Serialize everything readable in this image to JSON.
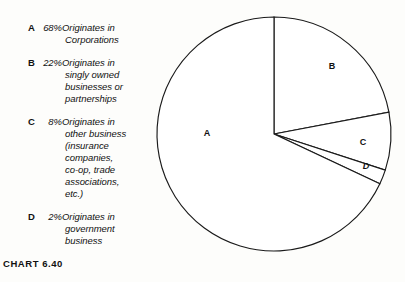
{
  "caption": "CHART 6.40",
  "legend": {
    "entries": [
      {
        "key": "A",
        "percent": "68%",
        "first_line": "Originates in",
        "rest_lines": [
          "Corporations"
        ],
        "full_text": "68% Originates in Corporations"
      },
      {
        "key": "B",
        "percent": "22%",
        "first_line": "Originates in",
        "rest_lines": [
          "singly owned",
          "businesses or",
          "partnerships"
        ],
        "full_text": "22% Originates in singly owned businesses or partnerships"
      },
      {
        "key": "C",
        "percent": "8%",
        "first_line": "Originates in",
        "rest_lines": [
          "other business",
          "(insurance",
          "companies,",
          "co-op, trade",
          "associations,",
          "etc.)"
        ],
        "full_text": "8% Originates in other business (insurance companies, co-op, trade associations, etc.)"
      },
      {
        "key": "D",
        "percent": "2%",
        "first_line": "Originates in",
        "rest_lines": [
          "government",
          "business"
        ],
        "full_text": "2% Originates in government business"
      }
    ]
  },
  "pie_labels": {
    "a": "A",
    "b": "B",
    "c": "C",
    "d": "D"
  },
  "colors": {
    "slice_fill": "#ffffff",
    "slice_stroke": "#1a1a1a",
    "text": "#111111",
    "background": "#fdfdfb"
  },
  "chart_data": {
    "type": "pie",
    "title": "CHART 6.40",
    "subtitle": "",
    "xlabel": "",
    "ylabel": "",
    "grid": false,
    "legend_position": "left",
    "start_angle_deg": 0,
    "direction": "clockwise",
    "units": "percent",
    "categories": [
      "A",
      "B",
      "C",
      "D"
    ],
    "values": [
      68,
      22,
      8,
      2
    ],
    "labels": [
      "A 68% Originates in Corporations",
      "B 22% Originates in singly owned businesses or partnerships",
      "C 8% Originates in other business (insurance companies, co-op, trade associations, etc.)",
      "D 2% Originates in government business"
    ],
    "slices": [
      {
        "key": "A",
        "value": 68,
        "display_value": "68%",
        "description": "Originates in Corporations",
        "fill": "#ffffff",
        "stroke": "#1a1a1a",
        "label_in_chart": "A"
      },
      {
        "key": "B",
        "value": 22,
        "display_value": "22%",
        "description": "Originates in singly owned businesses or partnerships",
        "fill": "#ffffff",
        "stroke": "#1a1a1a",
        "label_in_chart": "B"
      },
      {
        "key": "C",
        "value": 8,
        "display_value": "8%",
        "description": "Originates in other business (insurance companies, co-op, trade associations, etc.)",
        "fill": "#ffffff",
        "stroke": "#1a1a1a",
        "label_in_chart": "C"
      },
      {
        "key": "D",
        "value": 2,
        "display_value": "2%",
        "description": "Originates in government business",
        "fill": "#ffffff",
        "stroke": "#1a1a1a",
        "label_in_chart": "D"
      }
    ],
    "total": 100
  }
}
